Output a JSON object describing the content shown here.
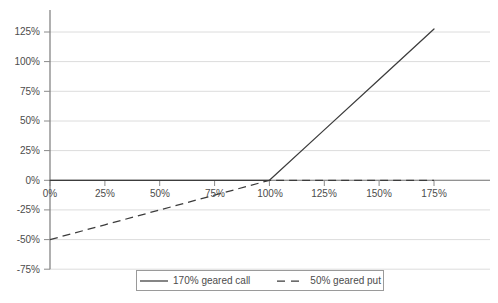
{
  "chart_data": {
    "type": "line",
    "title": "",
    "xlabel": "",
    "ylabel": "",
    "xlim": [
      0,
      175
    ],
    "ylim": [
      -75,
      137.5
    ],
    "grid": true,
    "x_tick_labels": [
      "0%",
      "25%",
      "50%",
      "75%",
      "100%",
      "125%",
      "150%",
      "175%"
    ],
    "x_tick_values": [
      0,
      25,
      50,
      75,
      100,
      125,
      150,
      175
    ],
    "y_tick_labels": [
      "125%",
      "100%",
      "75%",
      "50%",
      "25%",
      "0%",
      "-25%",
      "-50%",
      "-75%"
    ],
    "y_tick_values": [
      125,
      100,
      75,
      50,
      25,
      0,
      -25,
      -50,
      -75
    ],
    "legend_position": "bottom",
    "series": [
      {
        "name": "170% geared call",
        "style": "solid",
        "color": "#3c3c3c",
        "x": [
          0,
          25,
          50,
          75,
          100,
          125,
          150,
          175
        ],
        "values": [
          0,
          0,
          0,
          0,
          0,
          42.5,
          85,
          127.5
        ]
      },
      {
        "name": "50% geared put",
        "style": "dashed",
        "color": "#3c3c3c",
        "x": [
          0,
          25,
          50,
          75,
          100,
          125,
          150,
          175
        ],
        "values": [
          -50,
          -37.5,
          -25,
          -12.5,
          0,
          0,
          0,
          0
        ]
      }
    ]
  },
  "axis": {
    "zero_line_label": "0%",
    "y_axis_color": "#6e6e6e",
    "grid_color": "#d9d9d9",
    "tick_color": "#8a8a8a",
    "text_color": "#4c4c4c"
  },
  "legend": {
    "entries": [
      {
        "label": "170% geared call",
        "style": "solid"
      },
      {
        "label": "50% geared put",
        "style": "dashed"
      }
    ]
  }
}
